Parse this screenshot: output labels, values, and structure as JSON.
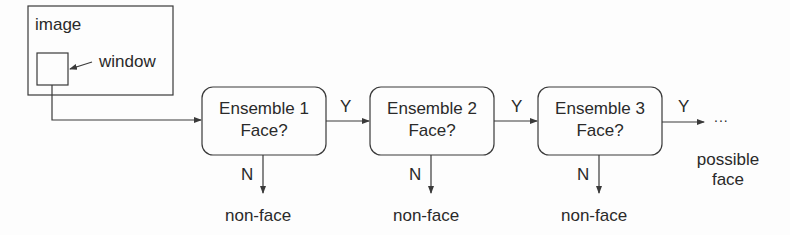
{
  "diagram": {
    "type": "flowchart",
    "title": "",
    "input": {
      "image_label": "image",
      "window_label": "window"
    },
    "stages": [
      {
        "line1": "Ensemble 1",
        "line2": "Face?",
        "yes_label": "Y",
        "no_label": "N",
        "reject_label": "non-face"
      },
      {
        "line1": "Ensemble 2",
        "line2": "Face?",
        "yes_label": "Y",
        "no_label": "N",
        "reject_label": "non-face"
      },
      {
        "line1": "Ensemble 3",
        "line2": "Face?",
        "yes_label": "Y",
        "no_label": "N",
        "reject_label": "non-face"
      }
    ],
    "continuation": "...",
    "output_label_line1": "possible",
    "output_label_line2": "face",
    "colors": {
      "stroke": "#3a3a3a",
      "text": "#2a2a2a",
      "background": "#fdfdfd"
    }
  }
}
